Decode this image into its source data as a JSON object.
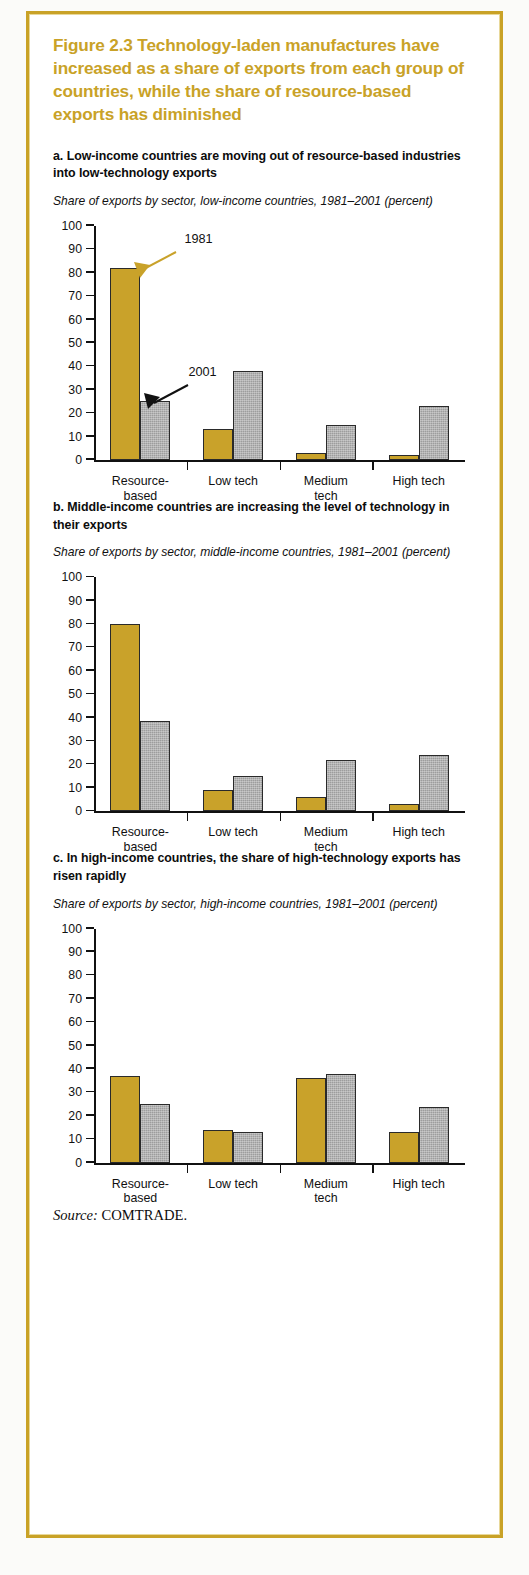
{
  "figure": {
    "title": "Figure 2.3  Technology-laden manufactures have increased as a share of exports from each group of countries, while the share of resource-based exports has diminished",
    "title_color": "#c9a227",
    "source_label": "Source:",
    "source_value": " COMTRADE.",
    "frame_color": "#c9a227"
  },
  "legend": {
    "series_1981": "1981",
    "series_2001": "2001",
    "color_1981": "#c9a22a",
    "color_2001": "#9d9d9d"
  },
  "panels": [
    {
      "key": "a",
      "heading": "a. Low-income countries are moving out of resource-based industries into low-technology exports",
      "subtitle": "Share of exports by sector, low-income countries, 1981–2001 (percent)",
      "annotation_1981": "1981",
      "annotation_2001": "2001"
    },
    {
      "key": "b",
      "heading": "b. Middle-income countries are increasing the level of technology in their exports",
      "subtitle": "Share of exports by sector, middle-income countries, 1981–2001 (percent)"
    },
    {
      "key": "c",
      "heading": "c. In high-income countries, the share of high-technology exports has risen rapidly",
      "subtitle": "Share of exports by sector, high-income countries, 1981–2001 (percent)"
    }
  ],
  "chart_data": [
    {
      "type": "bar",
      "panel": "a",
      "title": "a. Low-income countries are moving out of resource-based industries into low-technology exports",
      "subtitle": "Share of exports by sector, low-income countries, 1981–2001 (percent)",
      "xlabel": "",
      "ylabel": "percent",
      "ylim": [
        0,
        100
      ],
      "yticks": [
        0,
        10,
        20,
        30,
        40,
        50,
        60,
        70,
        80,
        90,
        100
      ],
      "ytick_labels": [
        "0",
        "10",
        "20",
        "30",
        "40",
        "50",
        "60",
        "70",
        "80",
        "90",
        "100"
      ],
      "grid": false,
      "legend_position": "annotations-on-bars",
      "categories": [
        "Resource-\nbased",
        "Low tech",
        "Medium\ntech",
        "High tech"
      ],
      "series": [
        {
          "name": "1981",
          "color": "#c9a22a",
          "values": [
            82,
            13,
            3,
            2
          ]
        },
        {
          "name": "2001",
          "color": "#9d9d9d",
          "values": [
            25,
            38,
            15,
            23
          ]
        }
      ],
      "annotations": [
        {
          "text": "1981",
          "points_to": "Resource-based 1981 bar",
          "arrow_color": "#c9a22a"
        },
        {
          "text": "2001",
          "points_to": "Resource-based 2001 bar",
          "arrow_color": "#111111"
        }
      ]
    },
    {
      "type": "bar",
      "panel": "b",
      "title": "b. Middle-income countries are increasing the level of technology in their exports",
      "subtitle": "Share of exports by sector, middle-income countries, 1981–2001 (percent)",
      "xlabel": "",
      "ylabel": "percent",
      "ylim": [
        0,
        100
      ],
      "yticks": [
        0,
        10,
        20,
        30,
        40,
        50,
        60,
        70,
        80,
        90,
        100
      ],
      "ytick_labels": [
        "0",
        "10",
        "20",
        "30",
        "40",
        "50",
        "60",
        "70",
        "80",
        "90",
        "100"
      ],
      "grid": false,
      "legend_position": "none",
      "categories": [
        "Resource-\nbased",
        "Low tech",
        "Medium\ntech",
        "High tech"
      ],
      "series": [
        {
          "name": "1981",
          "color": "#c9a22a",
          "values": [
            80,
            9,
            6,
            3
          ]
        },
        {
          "name": "2001",
          "color": "#9d9d9d",
          "values": [
            38.5,
            15,
            22,
            24
          ]
        }
      ],
      "annotations": []
    },
    {
      "type": "bar",
      "panel": "c",
      "title": "c. In high-income countries, the share of high-technology exports has risen rapidly",
      "subtitle": "Share of exports by sector, high-income countries, 1981–2001 (percent)",
      "xlabel": "",
      "ylabel": "percent",
      "ylim": [
        0,
        100
      ],
      "yticks": [
        0,
        10,
        20,
        30,
        40,
        50,
        60,
        70,
        80,
        90,
        100
      ],
      "ytick_labels": [
        "0",
        "10",
        "20",
        "30",
        "40",
        "50",
        "60",
        "70",
        "80",
        "90",
        "100"
      ],
      "grid": false,
      "legend_position": "none",
      "categories": [
        "Resource-\nbased",
        "Low tech",
        "Medium\ntech",
        "High tech"
      ],
      "series": [
        {
          "name": "1981",
          "color": "#c9a22a",
          "values": [
            37,
            14,
            36,
            13
          ]
        },
        {
          "name": "2001",
          "color": "#9d9d9d",
          "values": [
            25,
            13,
            38,
            24
          ]
        }
      ],
      "annotations": []
    }
  ]
}
